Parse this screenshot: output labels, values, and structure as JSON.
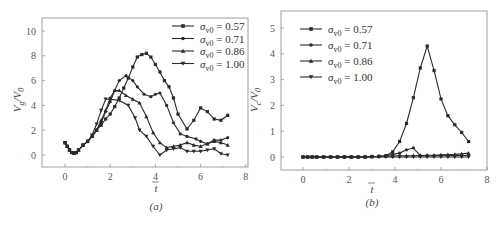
{
  "chart_data": [
    {
      "type": "line",
      "panel_label": "(a)",
      "title": "",
      "xlabel": "t̄",
      "ylabel": "V_g / V_0",
      "xlim": [
        -1,
        8
      ],
      "ylim": [
        -0.9,
        10.9
      ],
      "xticks": [
        0,
        2,
        4,
        6,
        8
      ],
      "yticks": [
        0,
        2,
        4,
        6,
        8,
        10
      ],
      "grid": false,
      "legend_position": "upper right",
      "series": [
        {
          "name": "σv0 = 0.57",
          "marker": "square",
          "x": [
            0,
            0.1,
            0.2,
            0.3,
            0.4,
            0.5,
            0.6,
            0.8,
            1.0,
            1.2,
            1.4,
            1.6,
            1.8,
            2.0,
            2.2,
            2.4,
            2.6,
            2.8,
            3.0,
            3.2,
            3.4,
            3.6,
            3.8,
            4.0,
            4.2,
            4.4,
            4.6,
            4.8,
            5.0,
            5.4,
            5.7,
            6.0,
            6.3,
            6.6,
            6.9,
            7.2
          ],
          "y": [
            1.0,
            0.7,
            0.4,
            0.2,
            0.15,
            0.2,
            0.4,
            0.8,
            1.1,
            1.5,
            2.0,
            2.4,
            2.9,
            3.3,
            3.9,
            4.6,
            5.4,
            6.2,
            7.1,
            7.9,
            8.1,
            8.2,
            7.9,
            7.3,
            6.7,
            6.0,
            5.5,
            4.6,
            3.3,
            2.1,
            2.8,
            3.8,
            3.5,
            2.9,
            2.8,
            3.2
          ]
        },
        {
          "name": "σv0 = 0.71",
          "marker": "circle",
          "x": [
            0,
            0.1,
            0.2,
            0.3,
            0.4,
            0.5,
            0.6,
            0.8,
            1.0,
            1.2,
            1.4,
            1.6,
            1.8,
            2.0,
            2.2,
            2.4,
            2.7,
            3.0,
            3.2,
            3.5,
            3.8,
            4.0,
            4.2,
            4.5,
            4.8,
            5.1,
            5.4,
            5.8,
            6.0,
            6.3,
            6.6,
            6.9,
            7.2
          ],
          "y": [
            1.0,
            0.7,
            0.4,
            0.2,
            0.15,
            0.2,
            0.4,
            0.8,
            1.1,
            1.5,
            2.0,
            2.6,
            3.5,
            4.3,
            5.2,
            6.0,
            6.4,
            6.0,
            5.5,
            4.9,
            4.7,
            4.9,
            5.0,
            4.0,
            2.6,
            1.7,
            1.5,
            1.3,
            1.1,
            0.9,
            1.2,
            1.2,
            1.4
          ]
        },
        {
          "name": "σv0 = 0.86",
          "marker": "triangle-up",
          "x": [
            0,
            0.1,
            0.2,
            0.3,
            0.4,
            0.5,
            0.6,
            0.8,
            1.0,
            1.2,
            1.4,
            1.6,
            1.8,
            2.0,
            2.2,
            2.4,
            2.7,
            3.0,
            3.3,
            3.6,
            3.9,
            4.2,
            4.5,
            4.8,
            5.1,
            5.4,
            5.7,
            6.0,
            6.3,
            6.6,
            6.9,
            7.2
          ],
          "y": [
            1.0,
            0.7,
            0.4,
            0.2,
            0.15,
            0.2,
            0.4,
            0.8,
            1.1,
            1.5,
            2.0,
            2.8,
            3.6,
            4.6,
            5.2,
            5.2,
            4.8,
            4.5,
            4.2,
            3.1,
            1.8,
            1.0,
            0.6,
            0.7,
            0.8,
            1.0,
            0.8,
            0.7,
            0.9,
            1.1,
            1.0,
            0.8
          ]
        },
        {
          "name": "σv0 = 1.00",
          "marker": "triangle-down",
          "x": [
            0,
            0.1,
            0.2,
            0.3,
            0.4,
            0.5,
            0.6,
            0.8,
            1.0,
            1.2,
            1.4,
            1.6,
            1.8,
            2.0,
            2.4,
            2.8,
            3.1,
            3.3,
            3.6,
            3.9,
            4.2,
            4.5,
            4.8,
            5.1,
            5.4,
            5.7,
            6.0,
            6.3,
            6.6,
            6.9,
            7.2
          ],
          "y": [
            1.0,
            0.7,
            0.4,
            0.2,
            0.15,
            0.2,
            0.4,
            0.8,
            1.1,
            1.6,
            2.5,
            3.6,
            4.5,
            4.5,
            4.4,
            4.0,
            3.0,
            2.0,
            1.5,
            0.7,
            0.0,
            0.4,
            0.5,
            0.6,
            0.3,
            0.3,
            0.3,
            0.4,
            0.5,
            0.1,
            0.0
          ]
        }
      ]
    },
    {
      "type": "line",
      "panel_label": "(b)",
      "title": "",
      "xlabel": "t̄",
      "ylabel": "V_c / V_0",
      "xlim": [
        -1,
        8
      ],
      "ylim": [
        -0.5,
        5.5
      ],
      "xticks": [
        0,
        2,
        4,
        6,
        8
      ],
      "yticks": [
        0,
        1,
        2,
        3,
        4,
        5
      ],
      "grid": false,
      "legend_position": "upper left",
      "series": [
        {
          "name": "σv0 = 0.57",
          "marker": "square",
          "x": [
            0,
            0.2,
            0.4,
            0.6,
            0.9,
            1.2,
            1.5,
            1.8,
            2.1,
            2.4,
            2.7,
            3.0,
            3.3,
            3.6,
            3.9,
            4.2,
            4.5,
            4.8,
            5.1,
            5.4,
            5.7,
            6.0,
            6.3,
            6.6,
            6.9,
            7.2
          ],
          "y": [
            0,
            0,
            0,
            0,
            0,
            0,
            0,
            0,
            0,
            0,
            0,
            0.02,
            0.03,
            0.05,
            0.2,
            0.6,
            1.3,
            2.3,
            3.45,
            4.3,
            3.35,
            2.25,
            1.6,
            1.25,
            0.95,
            0.6
          ]
        },
        {
          "name": "σv0 = 0.71",
          "marker": "circle",
          "x": [
            0,
            0.2,
            0.4,
            0.6,
            0.9,
            1.2,
            1.5,
            1.8,
            2.1,
            2.4,
            2.7,
            3.0,
            3.3,
            3.6,
            3.9,
            4.2,
            4.5,
            4.8,
            5.1,
            5.4,
            5.7,
            6.0,
            6.3,
            6.6,
            6.9,
            7.2
          ],
          "y": [
            0,
            0,
            0,
            0,
            0,
            0,
            0,
            0,
            0,
            0,
            0,
            0.02,
            0.03,
            0.05,
            0.1,
            0.15,
            0.28,
            0.35,
            0.05,
            0.05,
            0.05,
            0.06,
            0.06,
            0.06,
            0.06,
            0.06
          ]
        },
        {
          "name": "σv0 = 0.86",
          "marker": "triangle-up",
          "x": [
            0,
            0.2,
            0.4,
            0.6,
            0.9,
            1.2,
            1.5,
            1.8,
            2.1,
            2.4,
            2.7,
            3.0,
            3.3,
            3.6,
            3.9,
            4.2,
            4.5,
            4.8,
            5.1,
            5.4,
            5.7,
            6.0,
            6.3,
            6.6,
            6.9,
            7.2
          ],
          "y": [
            0,
            0,
            0,
            0,
            0,
            0,
            0,
            0,
            0,
            0,
            0,
            0.01,
            0.02,
            0.03,
            0.04,
            0.05,
            0.05,
            0.05,
            0.06,
            0.07,
            0.07,
            0.08,
            0.09,
            0.1,
            0.12,
            0.15
          ]
        },
        {
          "name": "σv0 = 1.00",
          "marker": "triangle-down",
          "x": [
            0,
            0.2,
            0.4,
            0.6,
            0.9,
            1.2,
            1.5,
            1.8,
            2.1,
            2.4,
            2.7,
            3.0,
            3.3,
            3.6,
            3.9,
            4.2,
            4.5,
            4.8,
            5.1,
            5.4,
            5.7,
            6.0,
            6.3,
            6.6,
            6.9,
            7.2
          ],
          "y": [
            0,
            0,
            0,
            0,
            0,
            0,
            0,
            0,
            0,
            0,
            0,
            0,
            0,
            0,
            0,
            0,
            0,
            0,
            0,
            0,
            0,
            0,
            0,
            0,
            0,
            0
          ]
        }
      ]
    }
  ],
  "panels": {
    "a": {
      "label": "(a)",
      "xlabel": "t",
      "ylabel_main": "V",
      "ylabel_sub": "g",
      "ylabel_den": "/V",
      "ylabel_den_sub": "0",
      "yticks": [
        "0",
        "2",
        "4",
        "6",
        "8",
        "10"
      ],
      "xticks": [
        "0",
        "2",
        "4",
        "6",
        "8"
      ],
      "legend": [
        "= 0.57",
        "= 0.71",
        "= 0.86",
        "= 1.00"
      ]
    },
    "b": {
      "label": "(b)",
      "xlabel": "t",
      "ylabel_main": "V",
      "ylabel_sub": "c",
      "ylabel_den": "/V",
      "ylabel_den_sub": "0",
      "yticks": [
        "0",
        "1",
        "2",
        "3",
        "4",
        "5"
      ],
      "xticks": [
        "0",
        "2",
        "4",
        "6",
        "8"
      ],
      "legend": [
        "= 0.57",
        "= 0.71",
        "= 0.86",
        "= 1.00"
      ]
    },
    "legend_symbol": "σ",
    "legend_sub": "v0"
  },
  "colors": {
    "line": "#2a2a2a",
    "frame": "#777777",
    "text": "#444444"
  }
}
